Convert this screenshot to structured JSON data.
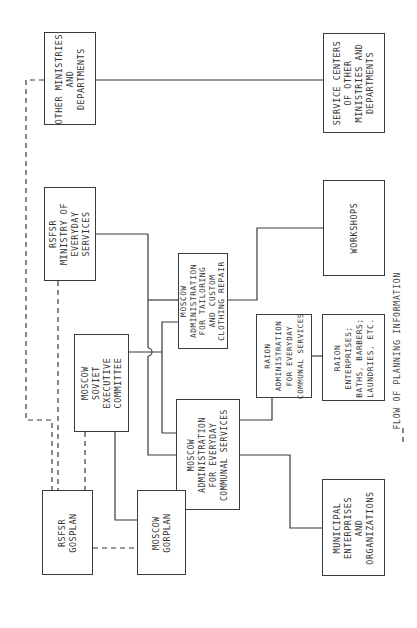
{
  "diagram": {
    "orientation": "rotated 90 degrees counter-clockwise",
    "boxes": {
      "other_ministries": {
        "label": "OTHER MINISTRIES\nAND\nDEPARTMENTS"
      },
      "service_centers": {
        "label": "SERVICE CENTERS\nOF OTHER\nMINISTRIES AND\nDEPARTMENTS"
      },
      "rsfsr_ministry": {
        "label": "RSFSR\nMINISTRY OF\nEVERYDAY\nSERVICES"
      },
      "workshops": {
        "label": "WORKSHOPS"
      },
      "moscow_tailoring": {
        "label": "MOSCOW\nADMINISTRATION\nFOR TAILORING\nAND CUSTOM\nCLOTHING REPAIR"
      },
      "raion_admin": {
        "label": "RAION\nADMINISTRATION\nFOR EVERYDAY\nCOMMUNAL SERVICES"
      },
      "raion_enterprises": {
        "label": "RAION\nENTERPRISES;\nBATHS, BARBERS;\nLAUNDRIES, ETC."
      },
      "moscow_soviet": {
        "label": "MOSCOW\nSOVIET\nEXECUTIVE\nCOMMITTEE"
      },
      "moscow_communal": {
        "label": "MOSCOW\nADMINISTRATION\nFOR EVERYDAY\nCOMMUNAL SERVICES"
      },
      "rsfsr_gosplan": {
        "label": "RSFSR\nGOSPLAN"
      },
      "moscow_gorplan": {
        "label": "MOSCOW\nGORPLAN"
      },
      "municipal_enterprises": {
        "label": "MUNICIPAL\nENTERPRISES\nAND\nORGANIZATIONS"
      }
    },
    "legend": {
      "dash_symbol": "— — —",
      "text": "FLOW OF PLANNING INFORMATION"
    },
    "colors": {
      "line": "#3a3a3a",
      "background": "#ffffff"
    }
  }
}
